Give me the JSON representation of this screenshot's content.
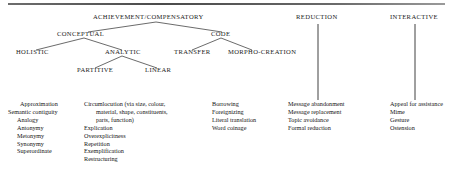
{
  "figure": {
    "root": {
      "label": "ACHIEVEMENT/COMPENSATORY"
    },
    "level2": [
      {
        "label": "CONCEPTUAL"
      },
      {
        "label": "CODE"
      }
    ],
    "level3": [
      {
        "label": "HOLISTIC"
      },
      {
        "label": "ANALYTIC"
      },
      {
        "label": "TRANSFER"
      },
      {
        "label": "MORPHO-CREATION"
      }
    ],
    "level4": [
      {
        "label": "PARTITIVE"
      },
      {
        "label": "LINEAR"
      }
    ],
    "right_headers": [
      {
        "label": "REDUCTION"
      },
      {
        "label": "INTERACTIVE"
      }
    ],
    "columns": [
      {
        "name": "conceptual-holistic-items",
        "items": [
          {
            "text": "Approximation",
            "indent": 1
          },
          {
            "text": "Semantic contiguity",
            "indent": 0
          },
          {
            "text": "Analogy",
            "indent": 2
          },
          {
            "text": "Antonymy",
            "indent": 2
          },
          {
            "text": "Metonymy",
            "indent": 2
          },
          {
            "text": "Synonymy",
            "indent": 2
          },
          {
            "text": "Superordinate",
            "indent": 2
          }
        ]
      },
      {
        "name": "analytic-items",
        "items": [
          {
            "text": "Circumlocution (via size, colour,",
            "indent": 0
          },
          {
            "text": "material, shape, constituents,",
            "indent": 1
          },
          {
            "text": "parts, function)",
            "indent": 1
          },
          {
            "text": "Explication",
            "indent": 0
          },
          {
            "text": "Overexplicitness",
            "indent": 0
          },
          {
            "text": "Repetition",
            "indent": 0
          },
          {
            "text": "Exemplification",
            "indent": 0
          },
          {
            "text": "Restructuring",
            "indent": 0
          }
        ]
      },
      {
        "name": "code-items",
        "items": [
          {
            "text": "Borrowing",
            "indent": 0
          },
          {
            "text": "Foreignizing",
            "indent": 0
          },
          {
            "text": "Literal translation",
            "indent": 0
          },
          {
            "text": "Word coinage",
            "indent": 0
          }
        ]
      },
      {
        "name": "reduction-items",
        "items": [
          {
            "text": "Message abandonment",
            "indent": 0
          },
          {
            "text": "Message replacement",
            "indent": 0
          },
          {
            "text": "Topic avoidance",
            "indent": 0
          },
          {
            "text": "Formal reduction",
            "indent": 0
          }
        ]
      },
      {
        "name": "interactive-items",
        "items": [
          {
            "text": "Appeal for assistance",
            "indent": 0
          },
          {
            "text": "Mime",
            "indent": 0
          },
          {
            "text": "Gesture",
            "indent": 0
          },
          {
            "text": "Ostension",
            "indent": 0
          }
        ]
      }
    ]
  }
}
